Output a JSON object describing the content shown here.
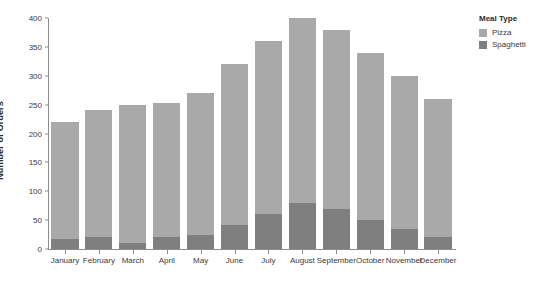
{
  "chart_data": {
    "type": "bar",
    "stacked": true,
    "title": "",
    "xlabel": "",
    "ylabel": "Number of Orders",
    "ylim": [
      0,
      400
    ],
    "yticks": [
      0,
      50,
      100,
      150,
      200,
      250,
      300,
      350,
      400
    ],
    "grid": false,
    "legend_position": "right",
    "legend_title": "Meal Type",
    "categories": [
      "January",
      "February",
      "March",
      "April",
      "May",
      "June",
      "July",
      "August",
      "September",
      "October",
      "November",
      "December"
    ],
    "series": [
      {
        "name": "Spaghetti",
        "color": "#7f7f7f",
        "values": [
          18,
          20,
          10,
          20,
          25,
          42,
          60,
          80,
          70,
          50,
          35,
          20
        ]
      },
      {
        "name": "Pizza",
        "color": "#a9a9a9",
        "values": [
          202,
          220,
          240,
          232,
          245,
          278,
          300,
          320,
          310,
          290,
          265,
          240
        ]
      }
    ],
    "totals": [
      220,
      240,
      250,
      252,
      270,
      320,
      360,
      400,
      380,
      340,
      300,
      260
    ]
  },
  "legend": {
    "title": "Meal Type",
    "items": [
      {
        "label": "Pizza",
        "color": "#a9a9a9"
      },
      {
        "label": "Spaghetti",
        "color": "#7f7f7f"
      }
    ]
  },
  "axes": {
    "y_title": "Number of Orders"
  }
}
